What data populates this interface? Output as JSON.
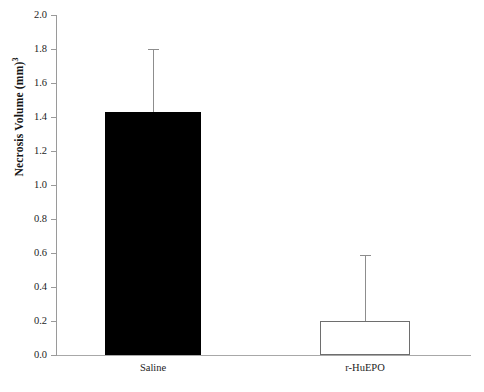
{
  "chart_data": {
    "type": "bar",
    "title": "",
    "xlabel": "",
    "ylabel": "Necrosis Volume (mm)",
    "ylabel_exponent": "3",
    "categories": [
      "Saline",
      "r-HuEPO"
    ],
    "values": [
      1.43,
      0.2
    ],
    "errors_upper": [
      1.8,
      0.59
    ],
    "error_bar_direction": "upper-only",
    "bar_styles": [
      "filled-black",
      "hollow-white"
    ],
    "ylim": [
      0.0,
      2.0
    ],
    "y_tick_step": 0.2,
    "ytick_labels": [
      "0.0",
      "0.2",
      "0.4",
      "0.6",
      "0.8",
      "1.0",
      "1.2",
      "1.4",
      "1.6",
      "1.8",
      "2.0"
    ],
    "ytick_values": [
      0.0,
      0.2,
      0.4,
      0.6,
      0.8,
      1.0,
      1.2,
      1.4,
      1.6,
      1.8,
      2.0
    ],
    "grid": false,
    "legend": "none",
    "series": [
      {
        "name": "Necrosis Volume",
        "values": [
          1.43,
          0.2
        ],
        "errors_upper": [
          1.8,
          0.59
        ]
      }
    ],
    "colors": {
      "bar_saline": "#000000",
      "bar_rhuepo": "#ffffff",
      "bar_rhuepo_edge": "#6e6e6e",
      "axis": "#9a9a9a",
      "error_bar": "#8d8d8d",
      "text": "#1d1d1d"
    }
  }
}
